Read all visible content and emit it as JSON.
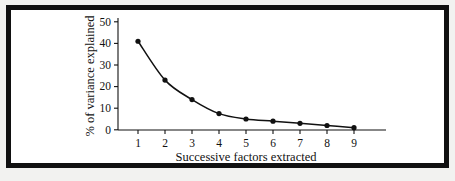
{
  "figure": {
    "background_color": "#ffffff",
    "frame_color": "#111111",
    "ink_color": "#111111"
  },
  "chart_data": {
    "type": "line",
    "title": "",
    "subtitle": "",
    "xlabel": "Successive factors extracted",
    "ylabel": "% of variance explained",
    "x": [
      1,
      2,
      3,
      4,
      5,
      6,
      7,
      8,
      9
    ],
    "values": [
      41,
      23,
      14,
      7.5,
      5,
      4,
      3,
      2,
      1
    ],
    "series": [
      {
        "name": "% of variance explained",
        "values": [
          41,
          23,
          14,
          7.5,
          5,
          4,
          3,
          2,
          1
        ]
      }
    ],
    "xtick_labels": [
      "1",
      "2",
      "3",
      "4",
      "5",
      "6",
      "7",
      "8",
      "9"
    ],
    "ytick_labels": [
      "0",
      "10",
      "20",
      "30",
      "40",
      "50"
    ],
    "yticks": [
      0,
      10,
      20,
      30,
      40,
      50
    ],
    "xlim": [
      0.6,
      9.9
    ],
    "ylim": [
      0,
      52
    ],
    "grid": false,
    "legend": false,
    "legend_position": "none",
    "marker": "filled-circle",
    "line_style": "solid",
    "annotations": []
  }
}
